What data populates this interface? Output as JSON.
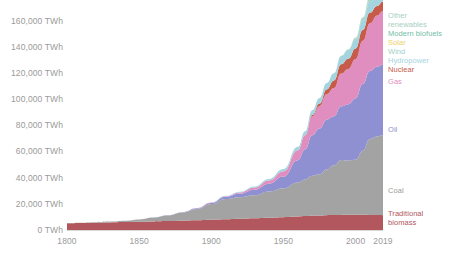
{
  "chart_data": {
    "type": "area",
    "stacked": true,
    "title": "",
    "subtitle": "",
    "xlabel": "",
    "ylabel": "",
    "xlim": [
      1800,
      2019
    ],
    "ylim": [
      0,
      170000
    ],
    "grid": false,
    "legend_position": "right",
    "unit": "TWh",
    "y_ticks": [
      {
        "value": 0,
        "label": "0 TWh"
      },
      {
        "value": 20000,
        "label": "20,000 TWh"
      },
      {
        "value": 40000,
        "label": "40,000 TWh"
      },
      {
        "value": 60000,
        "label": "60,000 TWh"
      },
      {
        "value": 80000,
        "label": "80,000 TWh"
      },
      {
        "value": 100000,
        "label": "100,000 TWh"
      },
      {
        "value": 120000,
        "label": "120,000 TWh"
      },
      {
        "value": 140000,
        "label": "140,000 TWh"
      },
      {
        "value": 160000,
        "label": "160,000 TWh"
      }
    ],
    "x_ticks": [
      {
        "value": 1800,
        "label": "1800"
      },
      {
        "value": 1850,
        "label": "1850"
      },
      {
        "value": 1900,
        "label": "1900"
      },
      {
        "value": 1950,
        "label": "1950"
      },
      {
        "value": 2000,
        "label": "2000"
      },
      {
        "value": 2019,
        "label": "2019"
      }
    ],
    "x": [
      1800,
      1810,
      1820,
      1830,
      1840,
      1850,
      1860,
      1870,
      1880,
      1890,
      1900,
      1910,
      1920,
      1930,
      1940,
      1950,
      1960,
      1965,
      1970,
      1975,
      1980,
      1985,
      1990,
      1995,
      2000,
      2005,
      2010,
      2015,
      2019
    ],
    "series": [
      {
        "name": "Traditional biomass",
        "color": "#b1575d",
        "label_color": "#b1575d",
        "values": [
          5600,
          5800,
          6000,
          6200,
          6400,
          6600,
          6900,
          7200,
          7500,
          7800,
          8200,
          8600,
          9000,
          9400,
          9800,
          10200,
          10700,
          11000,
          11300,
          11500,
          11700,
          11800,
          11900,
          11950,
          12000,
          12000,
          11900,
          11800,
          11700
        ]
      },
      {
        "name": "Coal",
        "color": "#a3a3a3",
        "label_color": "#9b9b9b",
        "values": [
          100,
          200,
          350,
          600,
          1100,
          1900,
          3000,
          4300,
          6200,
          8700,
          12000,
          15500,
          16500,
          17500,
          20000,
          22000,
          26000,
          28000,
          30500,
          31500,
          35000,
          38000,
          42000,
          41500,
          42000,
          49000,
          58000,
          60000,
          61000
        ]
      },
      {
        "name": "Oil",
        "color": "#8e90d1",
        "label_color": "#8e90d1",
        "values": [
          0,
          0,
          0,
          0,
          0,
          0,
          20,
          80,
          200,
          450,
          900,
          1700,
          2800,
          4300,
          6000,
          9000,
          17000,
          23000,
          31000,
          35000,
          38000,
          37500,
          41000,
          43000,
          47000,
          51000,
          52000,
          53500,
          54000
        ]
      },
      {
        "name": "Gas",
        "color": "#e08ec0",
        "label_color": "#e08ec0",
        "values": [
          0,
          0,
          0,
          0,
          0,
          0,
          0,
          10,
          30,
          80,
          200,
          400,
          800,
          1600,
          2400,
          4000,
          7500,
          10500,
          14500,
          17000,
          19500,
          21500,
          25000,
          27000,
          30000,
          33000,
          36500,
          39000,
          41000
        ]
      },
      {
        "name": "Nuclear",
        "color": "#c65b4a",
        "label_color": "#c65b4a",
        "values": [
          0,
          0,
          0,
          0,
          0,
          0,
          0,
          0,
          0,
          0,
          0,
          0,
          0,
          0,
          0,
          0,
          100,
          300,
          900,
          2000,
          3600,
          5800,
          7100,
          7800,
          8100,
          8200,
          8100,
          7300,
          7300
        ]
      },
      {
        "name": "Hydropower",
        "color": "#a4d4e0",
        "label_color": "#a4d4e0",
        "values": [
          0,
          0,
          0,
          0,
          0,
          0,
          0,
          0,
          20,
          60,
          150,
          350,
          600,
          900,
          1200,
          1700,
          2600,
          3100,
          3700,
          4200,
          4800,
          5500,
          6000,
          6400,
          6800,
          7100,
          8200,
          9000,
          9700
        ]
      },
      {
        "name": "Wind",
        "color": "#9fd2c8",
        "label_color": "#9fd2c8",
        "values": [
          0,
          0,
          0,
          0,
          0,
          0,
          0,
          0,
          0,
          0,
          0,
          0,
          0,
          0,
          0,
          0,
          0,
          0,
          0,
          0,
          0,
          10,
          40,
          100,
          250,
          600,
          1500,
          2900,
          3700
        ]
      },
      {
        "name": "Solar",
        "color": "#f0d878",
        "label_color": "#ecd26a",
        "values": [
          0,
          0,
          0,
          0,
          0,
          0,
          0,
          0,
          0,
          0,
          0,
          0,
          0,
          0,
          0,
          0,
          0,
          0,
          0,
          0,
          0,
          0,
          5,
          10,
          30,
          90,
          400,
          1400,
          2200
        ]
      },
      {
        "name": "Modern biofuels",
        "color": "#7fc4ae",
        "label_color": "#73bda6",
        "values": [
          0,
          0,
          0,
          0,
          0,
          0,
          0,
          0,
          0,
          0,
          0,
          0,
          0,
          0,
          0,
          0,
          0,
          0,
          0,
          0,
          20,
          80,
          200,
          350,
          600,
          900,
          1400,
          1700,
          1800
        ]
      },
      {
        "name": "Other renewables",
        "color": "#b8dcc8",
        "label_color": "#a8cfc0",
        "values": [
          0,
          0,
          0,
          0,
          0,
          0,
          0,
          0,
          0,
          0,
          0,
          0,
          0,
          0,
          0,
          0,
          0,
          0,
          0,
          0,
          50,
          150,
          300,
          450,
          700,
          1000,
          1400,
          1900,
          2300
        ]
      }
    ]
  },
  "legend": [
    {
      "id": "other-renewables",
      "text": "Other\nrenewables",
      "x": 388,
      "y": 12,
      "color": "#a8cfc0"
    },
    {
      "id": "modern-biofuels",
      "text": "Modern biofuels",
      "x": 388,
      "y": 30,
      "color": "#73bda6"
    },
    {
      "id": "solar",
      "text": "Solar",
      "x": 388,
      "y": 39,
      "color": "#ecd26a"
    },
    {
      "id": "wind",
      "text": "Wind",
      "x": 388,
      "y": 48,
      "color": "#9fd2c8"
    },
    {
      "id": "hydropower",
      "text": "Hydropower",
      "x": 388,
      "y": 57,
      "color": "#a4d4e0"
    },
    {
      "id": "nuclear",
      "text": "Nuclear",
      "x": 388,
      "y": 66,
      "color": "#c65b4a"
    },
    {
      "id": "gas",
      "text": "Gas",
      "x": 388,
      "y": 78,
      "color": "#e08ec0"
    },
    {
      "id": "oil",
      "text": "Oil",
      "x": 388,
      "y": 126,
      "color": "#8e90d1"
    },
    {
      "id": "coal",
      "text": "Coal",
      "x": 388,
      "y": 187,
      "color": "#9b9b9b"
    },
    {
      "id": "traditional-biomass",
      "text": "Traditional\nbiomass",
      "x": 388,
      "y": 210,
      "color": "#b1575d"
    }
  ]
}
